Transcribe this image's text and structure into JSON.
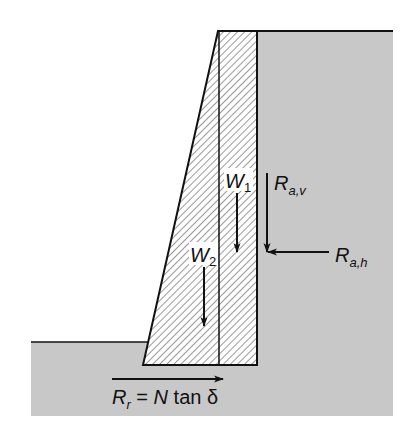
{
  "figure": {
    "colors": {
      "soil": "#c8c8c8",
      "wall_fill": "#ffffff",
      "hatch": "#444444",
      "line": "#111111",
      "background": "#ffffff"
    }
  },
  "labels": {
    "w1": {
      "main": "W",
      "sub": "1"
    },
    "w2": {
      "main": "W",
      "sub": "2"
    },
    "rav": {
      "main": "R",
      "sub": "a,v"
    },
    "rah": {
      "main": "R",
      "sub": "a,h"
    },
    "rr": {
      "main": "R",
      "sub": "r",
      "rest": " = ",
      "n": "N",
      "tan": " tan δ"
    }
  },
  "forces": [
    {
      "id": "W1",
      "direction": "down",
      "description": "weight of rectangular wall section"
    },
    {
      "id": "W2",
      "direction": "down",
      "description": "weight of triangular wall section"
    },
    {
      "id": "Ra,v",
      "direction": "down",
      "description": "vertical component of active earth resultant"
    },
    {
      "id": "Ra,h",
      "direction": "left",
      "description": "horizontal component of active earth resultant"
    },
    {
      "id": "Rr",
      "direction": "right",
      "description": "base sliding resistance R_r = N tan δ"
    }
  ]
}
